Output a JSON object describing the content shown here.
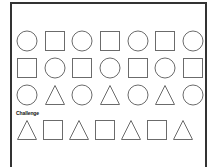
{
  "worksheet": {
    "rows": [
      [
        "circle",
        "square",
        "circle",
        "square",
        "circle",
        "square",
        "circle"
      ],
      [
        "square",
        "circle",
        "square",
        "circle",
        "square",
        "circle",
        "square"
      ],
      [
        "circle",
        "triangle",
        "circle",
        "triangle",
        "circle",
        "triangle",
        "circle"
      ]
    ],
    "challenge_label": "Challenge",
    "challenge_row": [
      "triangle",
      "square",
      "triangle",
      "square",
      "triangle",
      "square",
      "triangle"
    ],
    "stroke_color": "#6b6b6b",
    "border_color": "#333333"
  }
}
